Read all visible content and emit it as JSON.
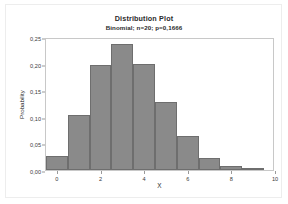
{
  "figure": {
    "background_color": "#ffffff",
    "frame_color": "#ededed"
  },
  "chart_data": {
    "type": "bar",
    "title": "Distribution Plot",
    "subtitle": "Binomial; n=20; p=0,1666",
    "xlabel": "X",
    "ylabel": "Probability",
    "categories": [
      0,
      1,
      2,
      3,
      4,
      5,
      6,
      7,
      8,
      9
    ],
    "values": [
      0.026,
      0.104,
      0.198,
      0.237,
      0.2,
      0.127,
      0.063,
      0.023,
      0.007,
      0.001
    ],
    "xlim": [
      -0.5,
      10.0
    ],
    "ylim": [
      0.0,
      0.25
    ],
    "x_ticks": [
      "0",
      "2",
      "4",
      "6",
      "8",
      "10"
    ],
    "x_tick_values": [
      0,
      2,
      4,
      6,
      8,
      10
    ],
    "y_ticks": [
      "0,00",
      "0,05",
      "0,10",
      "0,15",
      "0,20",
      "0,25"
    ],
    "y_tick_values": [
      0.0,
      0.05,
      0.1,
      0.15,
      0.2,
      0.25
    ],
    "grid": false,
    "legend": false,
    "bar_color": "#8a8a8a",
    "bar_edge_color": "#6e6e6e",
    "axis_color": "#c8c8c8"
  }
}
